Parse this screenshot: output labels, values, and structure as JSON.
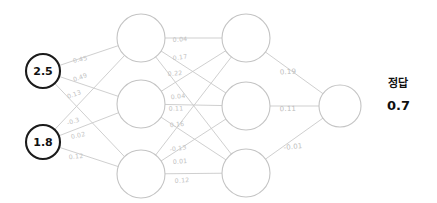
{
  "diagram": {
    "type": "neural-network",
    "layers": [
      {
        "name": "input-layer",
        "nodes": [
          {
            "id": "i1",
            "label": "2.5",
            "cx": 43,
            "cy": 71,
            "r": 17
          },
          {
            "id": "i2",
            "label": "1.8",
            "cx": 43,
            "cy": 142,
            "r": 17
          }
        ]
      },
      {
        "name": "hidden-layer-1",
        "nodes": [
          {
            "id": "h1",
            "label": "",
            "cx": 141,
            "cy": 38,
            "r": 24
          },
          {
            "id": "h2",
            "label": "",
            "cx": 141,
            "cy": 104,
            "r": 24
          },
          {
            "id": "h3",
            "label": "",
            "cx": 141,
            "cy": 174,
            "r": 24
          }
        ]
      },
      {
        "name": "hidden-layer-2",
        "nodes": [
          {
            "id": "k1",
            "label": "",
            "cx": 246,
            "cy": 38,
            "r": 24
          },
          {
            "id": "k2",
            "label": "",
            "cx": 246,
            "cy": 106,
            "r": 24
          },
          {
            "id": "k3",
            "label": "",
            "cx": 246,
            "cy": 173,
            "r": 24
          }
        ]
      },
      {
        "name": "output-layer",
        "nodes": [
          {
            "id": "o1",
            "label": "",
            "cx": 340,
            "cy": 106,
            "r": 21
          }
        ]
      }
    ],
    "edges": [
      {
        "from": "i1",
        "to": "h1"
      },
      {
        "from": "i1",
        "to": "h2"
      },
      {
        "from": "i1",
        "to": "h3"
      },
      {
        "from": "i2",
        "to": "h1"
      },
      {
        "from": "i2",
        "to": "h2"
      },
      {
        "from": "i2",
        "to": "h3"
      },
      {
        "from": "h1",
        "to": "k1"
      },
      {
        "from": "h1",
        "to": "k2"
      },
      {
        "from": "h1",
        "to": "k3"
      },
      {
        "from": "h2",
        "to": "k1"
      },
      {
        "from": "h2",
        "to": "k2"
      },
      {
        "from": "h2",
        "to": "k3"
      },
      {
        "from": "h3",
        "to": "k1"
      },
      {
        "from": "h3",
        "to": "k2"
      },
      {
        "from": "h3",
        "to": "k3"
      },
      {
        "from": "k1",
        "to": "o1"
      },
      {
        "from": "k2",
        "to": "o1"
      },
      {
        "from": "k3",
        "to": "o1"
      }
    ],
    "weight_labels": [
      {
        "id": "w-i1-h1",
        "text": "0.45",
        "x": 80,
        "y": 59,
        "rotate": -13,
        "group": "input-hidden1"
      },
      {
        "id": "w-i1-h2",
        "text": "0.49",
        "x": 80,
        "y": 77,
        "rotate": -19,
        "group": "input-hidden1"
      },
      {
        "id": "w-i1-h3",
        "text": "0.13",
        "x": 74,
        "y": 94,
        "rotate": -19,
        "group": "input-hidden1"
      },
      {
        "id": "w-i2-h1",
        "text": "-0.3",
        "x": 73,
        "y": 121,
        "rotate": -18,
        "group": "input-hidden1"
      },
      {
        "id": "w-i2-h2",
        "text": "0.02",
        "x": 78,
        "y": 135,
        "rotate": -13,
        "group": "input-hidden1"
      },
      {
        "id": "w-i2-h3",
        "text": "0.12",
        "x": 76,
        "y": 156,
        "rotate": -6,
        "group": "input-hidden1"
      },
      {
        "id": "w-h1-k1",
        "text": "0.04",
        "x": 180,
        "y": 39,
        "rotate": -3,
        "group": "hidden1-hidden2"
      },
      {
        "id": "w-h1-k2",
        "text": "0.17",
        "x": 180,
        "y": 57,
        "rotate": -7,
        "group": "hidden1-hidden2"
      },
      {
        "id": "w-h1-k3",
        "text": "0.22",
        "x": 175,
        "y": 73,
        "rotate": -3,
        "group": "hidden1-hidden2"
      },
      {
        "id": "w-h2-k1",
        "text": "0.04",
        "x": 178,
        "y": 96,
        "rotate": -6,
        "group": "hidden1-hidden2"
      },
      {
        "id": "w-h2-k2",
        "text": "0.11",
        "x": 176,
        "y": 108,
        "rotate": -2,
        "group": "hidden1-hidden2"
      },
      {
        "id": "w-h2-k3",
        "text": "0.16",
        "x": 177,
        "y": 124,
        "rotate": -5,
        "group": "hidden1-hidden2"
      },
      {
        "id": "w-h3-k1",
        "text": "-0.13",
        "x": 178,
        "y": 148,
        "rotate": -8,
        "group": "hidden1-hidden2"
      },
      {
        "id": "w-h3-k2",
        "text": "0.01",
        "x": 180,
        "y": 161,
        "rotate": -4,
        "group": "hidden1-hidden2"
      },
      {
        "id": "w-h3-k3",
        "text": "0.12",
        "x": 182,
        "y": 180,
        "rotate": -3,
        "group": "hidden1-hidden2"
      },
      {
        "id": "w-k1-o1",
        "text": "0.19",
        "x": 288,
        "y": 72,
        "rotate": -4,
        "group": "hidden2-output"
      },
      {
        "id": "w-k2-o1",
        "text": "0.11",
        "x": 288,
        "y": 109,
        "rotate": -2,
        "group": "hidden2-output"
      },
      {
        "id": "w-k3-o1",
        "text": "-0.01",
        "x": 293,
        "y": 147,
        "rotate": -6,
        "group": "hidden2-output"
      }
    ]
  },
  "annotation": {
    "answer_title": "정답",
    "answer_value": "0.7"
  }
}
